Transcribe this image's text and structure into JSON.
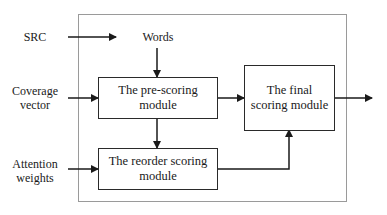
{
  "diagram": {
    "inputs": {
      "src": "SRC",
      "coverage": [
        "Coverage",
        "vector"
      ],
      "attention": [
        "Attention",
        "weights"
      ]
    },
    "words_label": "Words",
    "modules": {
      "prescoring": [
        "The pre-scoring",
        "module"
      ],
      "reorder": [
        "The reorder scoring",
        "module"
      ],
      "final": [
        "The final",
        "scoring module"
      ]
    },
    "edges": [
      {
        "from": "SRC",
        "to": "Words"
      },
      {
        "from": "Words",
        "to": "The pre-scoring module"
      },
      {
        "from": "Coverage vector",
        "to": "The pre-scoring module"
      },
      {
        "from": "Attention weights",
        "to": "The reorder scoring module"
      },
      {
        "from": "The pre-scoring module",
        "to": "The reorder scoring module"
      },
      {
        "from": "The pre-scoring module",
        "to": "The final scoring module"
      },
      {
        "from": "The reorder scoring module",
        "to": "The final scoring module"
      },
      {
        "from": "The final scoring module",
        "to": "output"
      }
    ],
    "colors": {
      "line": "#1a1a1a",
      "outer_border": "#9a9a9a"
    }
  }
}
